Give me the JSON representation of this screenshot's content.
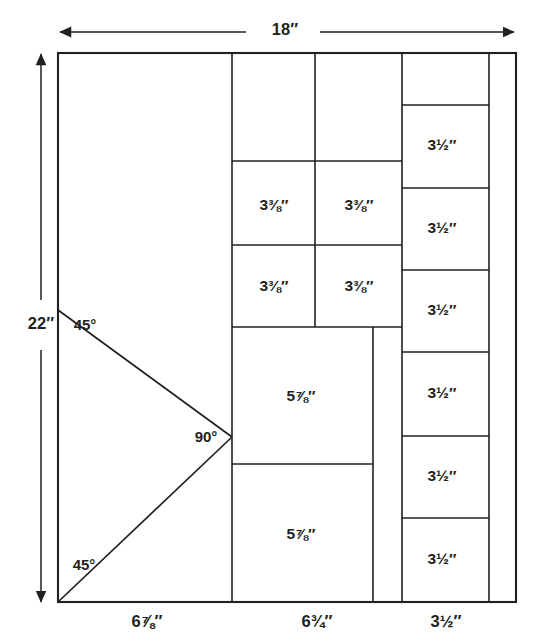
{
  "diagram": {
    "overall_width_label": "18″",
    "overall_height_label": "22″",
    "stroke_color": "#231f20",
    "background_color": "#ffffff",
    "bottom_dimensions": [
      {
        "name": "bottom-dim-left",
        "label": "6⅞″"
      },
      {
        "name": "bottom-dim-middle",
        "label": "6¾″"
      },
      {
        "name": "bottom-dim-right",
        "label": "3½″"
      }
    ],
    "angles": [
      {
        "name": "angle-top-left",
        "label": "45°"
      },
      {
        "name": "angle-apex",
        "label": "90°"
      },
      {
        "name": "angle-bottom-left",
        "label": "45°"
      }
    ],
    "pieces": [
      {
        "name": "piece-col2-row2-left",
        "label": "3⅜″"
      },
      {
        "name": "piece-col2-row2-right",
        "label": "3⅜″"
      },
      {
        "name": "piece-col2-row3-left",
        "label": "3⅜″"
      },
      {
        "name": "piece-col2-row3-right",
        "label": "3⅜″"
      },
      {
        "name": "piece-col2-row4",
        "label": "5⅞″"
      },
      {
        "name": "piece-col2-row5",
        "label": "5⅞″"
      },
      {
        "name": "piece-col3-row1",
        "label": "3½″"
      },
      {
        "name": "piece-col3-row2",
        "label": "3½″"
      },
      {
        "name": "piece-col3-row3",
        "label": "3½″"
      },
      {
        "name": "piece-col3-row4",
        "label": "3½″"
      },
      {
        "name": "piece-col3-row5",
        "label": "3½″"
      },
      {
        "name": "piece-col3-row6",
        "label": "3½″"
      }
    ]
  }
}
